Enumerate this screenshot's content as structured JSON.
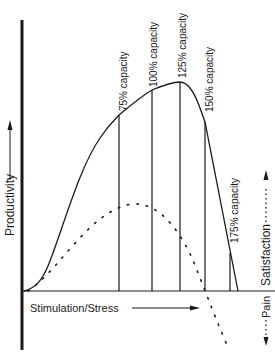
{
  "diagram": {
    "y_axis_label": "Productivity",
    "x_axis_label": "Stimulation/Stress",
    "right_labels": {
      "satisfaction": "Satisfaction",
      "pain": "Pain"
    },
    "capacity_markers": [
      {
        "label": "75% capacity"
      },
      {
        "label": "100% capacity"
      },
      {
        "label": "125% capacity"
      },
      {
        "label": "150% capacity"
      },
      {
        "label": "175% capacity"
      }
    ],
    "series": [
      {
        "name": "Productivity",
        "style": "solid"
      },
      {
        "name": "Satisfaction",
        "style": "dotted"
      }
    ],
    "colors": {
      "ink": "#1a1a1a",
      "background": "#ffffff"
    }
  }
}
